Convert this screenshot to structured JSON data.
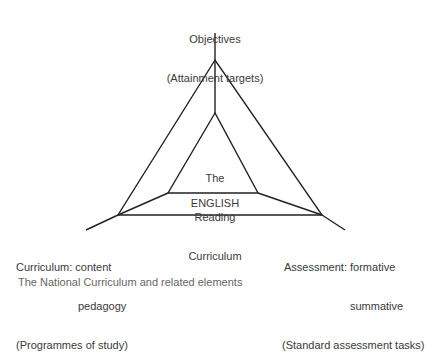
{
  "top_label": {
    "line1": "Objectives",
    "line2": "(Attainment targets)"
  },
  "left_label": {
    "line1": "Curriculum: content",
    "line2": "pedagogy",
    "line3": "(Programmes of study)"
  },
  "right_label": {
    "line1": "Assessment: formative",
    "line2": "summative",
    "line3": "(Standard assessment tasks)"
  },
  "inner_label": {
    "line1": "The",
    "line2": "Reading",
    "line3": "Curriculum"
  },
  "band_label": "ENGLISH",
  "caption": "The National Curriculum and related elements",
  "colors": {
    "line": "#222222",
    "text": "#3a3a3a",
    "background": "#ffffff"
  }
}
